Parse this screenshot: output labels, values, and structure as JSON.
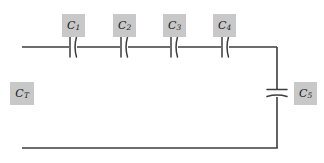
{
  "diagram": {
    "type": "electrical-schematic",
    "background_color": "#ffffff",
    "wire_color": "#3d3d3d",
    "label_box_color": "#c8c8c8",
    "label_text_color": "#1a1a1a",
    "canvas": {
      "width": 324,
      "height": 163
    }
  },
  "labels": [
    {
      "name": "label-ct",
      "symbol": "C",
      "subscript": "T",
      "x": 10,
      "y": 82,
      "w": 24,
      "h": 23
    },
    {
      "name": "label-c1",
      "symbol": "C",
      "subscript": "1",
      "x": 62,
      "y": 14,
      "w": 23,
      "h": 23
    },
    {
      "name": "label-c2",
      "symbol": "C",
      "subscript": "2",
      "x": 113,
      "y": 14,
      "w": 23,
      "h": 23
    },
    {
      "name": "label-c3",
      "symbol": "C",
      "subscript": "3",
      "x": 163,
      "y": 14,
      "w": 23,
      "h": 23
    },
    {
      "name": "label-c4",
      "symbol": "C",
      "subscript": "4",
      "x": 213,
      "y": 14,
      "w": 23,
      "h": 23
    },
    {
      "name": "label-c5",
      "symbol": "C",
      "subscript": "5",
      "x": 294,
      "y": 82,
      "w": 23,
      "h": 23
    }
  ],
  "wires": {
    "top": {
      "x1": 22,
      "y1": 47,
      "x2": 277,
      "y2": 47
    },
    "right": {
      "x1": 277,
      "y1": 47,
      "x2": 277,
      "y2": 148
    },
    "bottom": {
      "x1": 22,
      "y1": 148,
      "x2": 277,
      "y2": 148
    }
  },
  "capacitors": [
    {
      "name": "capacitor-c1",
      "orientation": "vertical",
      "cx": 73,
      "cy": 47
    },
    {
      "name": "capacitor-c2",
      "orientation": "vertical",
      "cx": 124,
      "cy": 47
    },
    {
      "name": "capacitor-c3",
      "orientation": "vertical",
      "cx": 174,
      "cy": 47
    },
    {
      "name": "capacitor-c4",
      "orientation": "vertical",
      "cx": 225,
      "cy": 47
    },
    {
      "name": "capacitor-c5",
      "orientation": "horizontal",
      "cx": 277,
      "cy": 93
    }
  ]
}
